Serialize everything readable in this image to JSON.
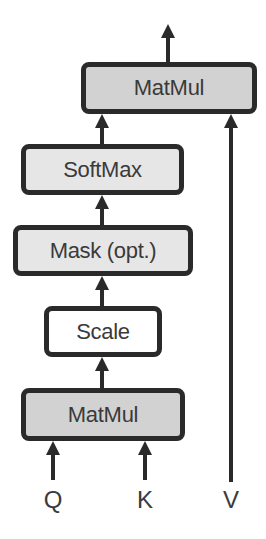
{
  "diagram": {
    "title": "",
    "colors": {
      "matmul_fill": "#d2d2d2",
      "light_fill": "#e6e6e6",
      "scale_fill": "#ffffff",
      "stroke": "#2a2a2a",
      "text": "#3a3a3a"
    },
    "nodes": [
      {
        "id": "matmul_top",
        "label": "MatMul"
      },
      {
        "id": "softmax",
        "label": "SoftMax"
      },
      {
        "id": "mask",
        "label": "Mask (opt.)"
      },
      {
        "id": "scale",
        "label": "Scale"
      },
      {
        "id": "matmul_bottom",
        "label": "MatMul"
      }
    ],
    "inputs": [
      {
        "id": "q",
        "label": "Q"
      },
      {
        "id": "k",
        "label": "K"
      },
      {
        "id": "v",
        "label": "V"
      }
    ],
    "edges": [
      {
        "from": "q",
        "to": "matmul_bottom"
      },
      {
        "from": "k",
        "to": "matmul_bottom"
      },
      {
        "from": "matmul_bottom",
        "to": "scale"
      },
      {
        "from": "scale",
        "to": "mask"
      },
      {
        "from": "mask",
        "to": "softmax"
      },
      {
        "from": "softmax",
        "to": "matmul_top"
      },
      {
        "from": "v",
        "to": "matmul_top"
      },
      {
        "from": "matmul_top",
        "to": "output"
      }
    ]
  }
}
